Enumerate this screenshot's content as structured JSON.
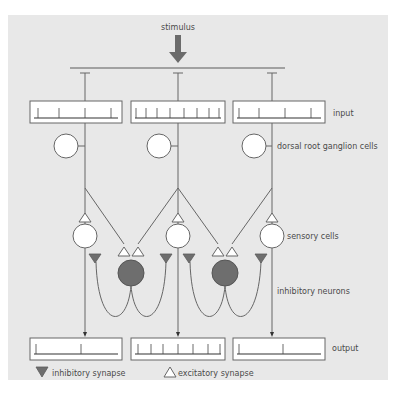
{
  "diagram": {
    "title_label": "stimulus",
    "labels": {
      "input": "input",
      "drg": "dorsal root ganglion cells",
      "sensory": "sensory cells",
      "inhibitory": "inhibitory neurons",
      "output": "output"
    },
    "legend": {
      "inhibitory": "inhibitory synapse",
      "excitatory": "excitatory synapse"
    },
    "input_boxes": [
      {
        "ticks": 4
      },
      {
        "ticks": 8
      },
      {
        "ticks": 4
      }
    ],
    "output_boxes": [
      {
        "ticks": 2
      },
      {
        "ticks": 7
      },
      {
        "ticks": 2
      }
    ],
    "colors": {
      "panel": "#e8e8e8",
      "line": "#666666",
      "inhibitory_fill": "#6e6e6e",
      "excitatory_fill": "#ffffff",
      "stimulus_arrow": "#6b6b6b"
    }
  }
}
